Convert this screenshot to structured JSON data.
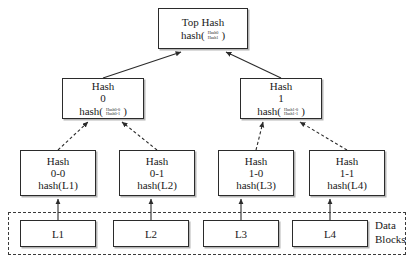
{
  "diagram": {
    "type": "merkle-tree",
    "background": "#ffffff",
    "line_color": "#2b2b2b",
    "nodes": {
      "top": {
        "title": "Top Hash",
        "formula_prefix": "hash(",
        "operand_top": "Hash0",
        "operand_bottom": "Hash1",
        "formula_suffix": ")"
      },
      "hash0": {
        "title": "Hash\n0",
        "formula_prefix": "hash(",
        "operand_top": "Hash0-0",
        "operand_bottom": "Hash0-1",
        "formula_suffix": ")"
      },
      "hash1": {
        "title": "Hash\n1",
        "formula_prefix": "hash(",
        "operand_top": "Hash1-0",
        "operand_bottom": "Hash1-1",
        "formula_suffix": ")"
      },
      "hash00": {
        "title": "Hash",
        "sub": "0-0",
        "formula": "hash(L1)"
      },
      "hash01": {
        "title": "Hash",
        "sub": "0-1",
        "formula": "hash(L2)"
      },
      "hash10": {
        "title": "Hash",
        "sub": "1-0",
        "formula": "hash(L3)"
      },
      "hash11": {
        "title": "Hash",
        "sub": "1-1",
        "formula": "hash(L4)"
      }
    },
    "data_blocks": {
      "label": "Data\nBlocks",
      "items": [
        {
          "label": "L1"
        },
        {
          "label": "L2"
        },
        {
          "label": "L3"
        },
        {
          "label": "L4"
        }
      ]
    }
  }
}
